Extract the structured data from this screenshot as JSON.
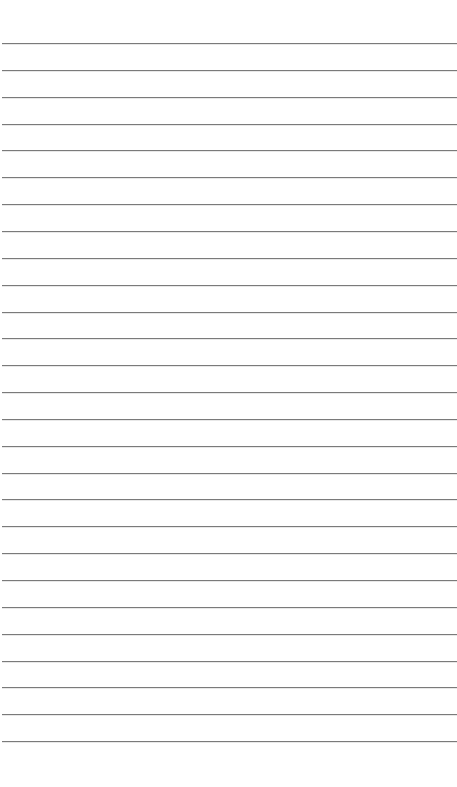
{
  "page": {
    "type": "lined-paper",
    "background": "#ffffff",
    "line_color": "#7a7a7a",
    "line_count": 27,
    "first_line_y": 43,
    "line_spacing": 26.85,
    "line_left": 2
  }
}
